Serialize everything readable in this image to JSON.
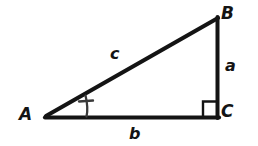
{
  "figure": {
    "name": "right-triangle-diagram",
    "background_color": "#ffffff",
    "stroke_color": "#141414"
  },
  "vertices": [
    {
      "id": "A",
      "label": "A",
      "x": 46,
      "y": 117
    },
    {
      "id": "B",
      "label": "B",
      "x": 217,
      "y": 18
    },
    {
      "id": "C",
      "label": "C",
      "x": 217,
      "y": 117
    }
  ],
  "sides": [
    {
      "id": "a",
      "label": "a",
      "from": "B",
      "to": "C",
      "role": "opposite-leg"
    },
    {
      "id": "b",
      "label": "b",
      "from": "A",
      "to": "C",
      "role": "adjacent-leg"
    },
    {
      "id": "c",
      "label": "c",
      "from": "A",
      "to": "B",
      "role": "hypotenuse"
    }
  ],
  "markers": {
    "right_angle": {
      "name": "right-angle-square",
      "at_vertex": "C",
      "size": 14
    },
    "angle_arc": {
      "name": "angle-arc-A",
      "at_vertex": "A",
      "tick_marks": 1
    }
  }
}
